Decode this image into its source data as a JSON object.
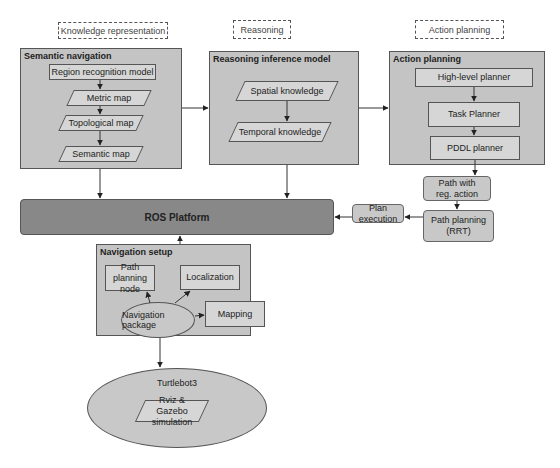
{
  "phases": {
    "knowledge": "Knowledge representation",
    "reasoning": "Reasoning",
    "action": "Action planning"
  },
  "semantic_navigation": {
    "title": "Semantic navigation",
    "region_model": "Region recognition model",
    "metric_map": "Metric map",
    "topological_map": "Topological map",
    "semantic_map": "Semantic map"
  },
  "reasoning_model": {
    "title": "Reasoning inference model",
    "spatial": "Spatial knowledge",
    "temporal": "Temporal knowledge"
  },
  "action_planning": {
    "title": "Action planning",
    "high_level": "High-level planner",
    "task": "Task Planner",
    "pddl": "PDDL planner"
  },
  "path_with_action": "Path with reg. action",
  "path_planning": "Path planning (RRT)",
  "plan_execution": "Plan execution",
  "ros_platform": "ROS Platform",
  "navigation_setup": {
    "title": "Navigation setup",
    "path_node": "Path planning node",
    "localization": "Localization",
    "mapping": "Mapping",
    "nav_package": "Navigation package"
  },
  "turtlebot": {
    "title": "Turtlebot3",
    "sim": "Rviz & Gazebo simulation"
  }
}
